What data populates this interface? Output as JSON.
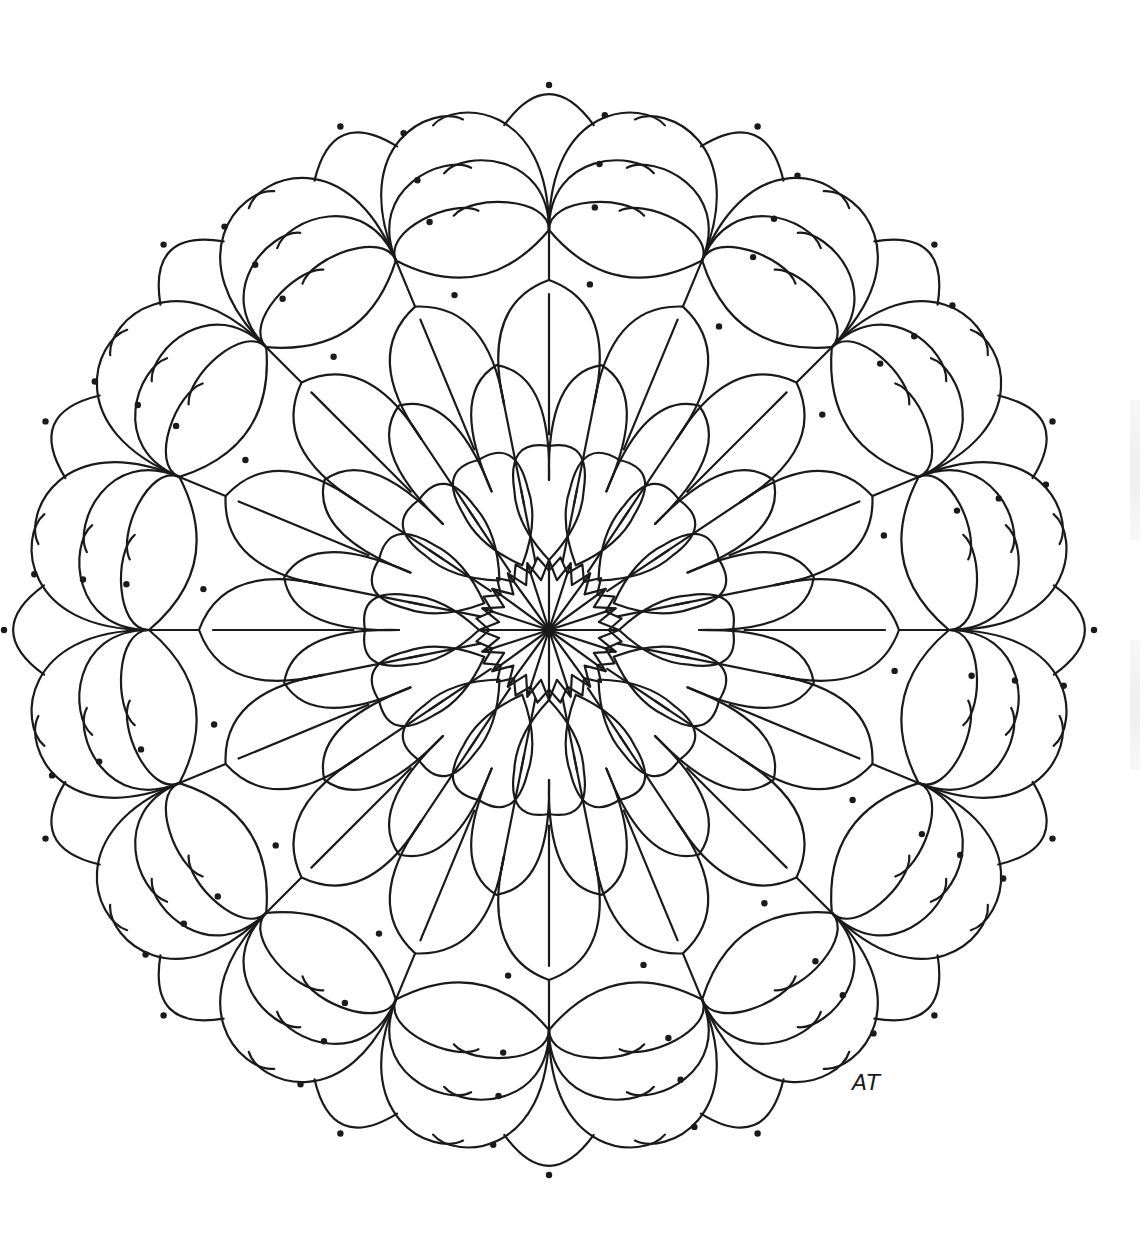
{
  "artwork": {
    "title": "Mandala coloring page",
    "signature": "AT",
    "center": [
      549,
      630
    ],
    "stroke_color": "#1a1a1a",
    "background": "#ffffff",
    "rings": [
      {
        "name": "center-star",
        "count": 20,
        "inner_r": 12,
        "outer_r": 70
      },
      {
        "name": "teardrop-ring",
        "count": 16,
        "inner_r": 60,
        "outer_r": 200
      },
      {
        "name": "petal-ring-inner",
        "count": 16,
        "inner_r": 150,
        "outer_r": 270
      },
      {
        "name": "petal-ring-outer",
        "count": 16,
        "inner_r": 230,
        "outer_r": 350
      },
      {
        "name": "outer-lobe-ring",
        "count": 16,
        "inner_r": 340,
        "outer_r": 545
      }
    ]
  }
}
